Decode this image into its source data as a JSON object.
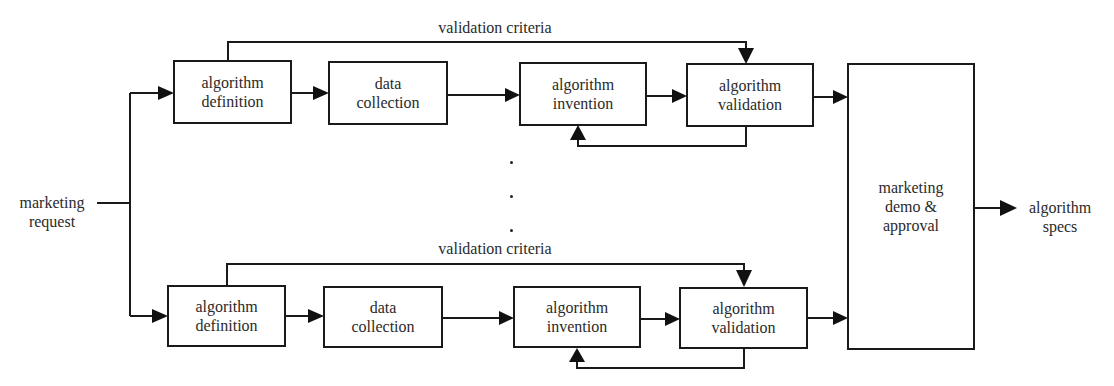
{
  "diagram": {
    "input": {
      "line1": "marketing",
      "line2": "request"
    },
    "rows": [
      {
        "validation_label": "validation criteria",
        "steps": [
          {
            "line1": "algorithm",
            "line2": "definition"
          },
          {
            "line1": "data",
            "line2": "collection"
          },
          {
            "line1": "algorithm",
            "line2": "invention"
          },
          {
            "line1": "algorithm",
            "line2": "validation"
          }
        ]
      },
      {
        "validation_label": "validation criteria",
        "steps": [
          {
            "line1": "algorithm",
            "line2": "definition"
          },
          {
            "line1": "data",
            "line2": "collection"
          },
          {
            "line1": "algorithm",
            "line2": "invention"
          },
          {
            "line1": "algorithm",
            "line2": "validation"
          }
        ]
      }
    ],
    "ellipsis": ".",
    "approval": {
      "line1": "marketing",
      "line2": "demo &",
      "line3": "approval"
    },
    "output": {
      "line1": "algorithm",
      "line2": "specs"
    }
  }
}
